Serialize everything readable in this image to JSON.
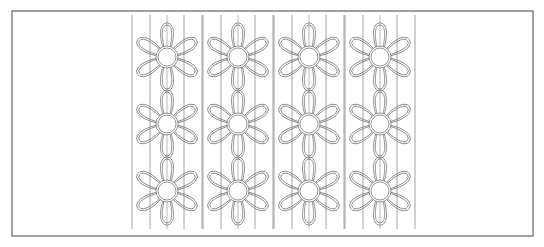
{
  "figure": {
    "width": 544,
    "height": 247,
    "background": "#ffffff",
    "frame": {
      "x": 12,
      "y": 11,
      "w": 521,
      "h": 225,
      "color": "#6f6f6f",
      "stroke": 1.3
    },
    "line_color": "#8a8a8a",
    "flower_color": "#7a7a7a"
  },
  "pattern": {
    "columns": 4,
    "rows": 3,
    "column_centers_x": [
      167,
      238,
      309,
      380
    ],
    "row_centers_y": [
      57,
      124,
      191
    ],
    "vertical_lines": {
      "y_top": 15,
      "y_bottom": 229,
      "offsets_from_center": [
        -35,
        -17,
        17,
        35
      ]
    },
    "flower": {
      "petal_count": 6,
      "center_radius": 11,
      "petal_length": 34,
      "petal_width": 14,
      "outline": "double"
    }
  }
}
